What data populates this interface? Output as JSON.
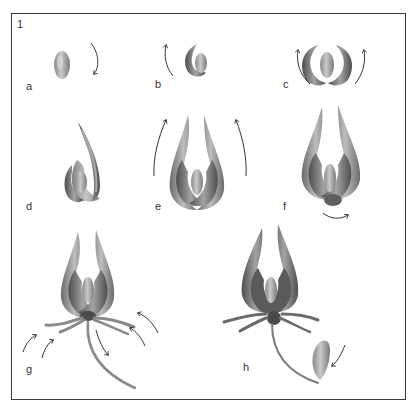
{
  "figure": {
    "number": "1",
    "steps": [
      {
        "label": "a",
        "x": 28,
        "y": 88
      },
      {
        "label": "b",
        "x": 157,
        "y": 86
      },
      {
        "label": "c",
        "x": 284,
        "y": 86
      },
      {
        "label": "d",
        "x": 28,
        "y": 208
      },
      {
        "label": "e",
        "x": 157,
        "y": 208
      },
      {
        "label": "f",
        "x": 284,
        "y": 208
      },
      {
        "label": "g",
        "x": 28,
        "y": 370
      },
      {
        "label": "h",
        "x": 244,
        "y": 368
      }
    ]
  },
  "colors": {
    "frame": "#3a3a3a",
    "stroke_dark": "#5a5a5a",
    "stroke_mid": "#8c8c8c",
    "stroke_light": "#b4b4b4",
    "arrow": "#333333"
  }
}
